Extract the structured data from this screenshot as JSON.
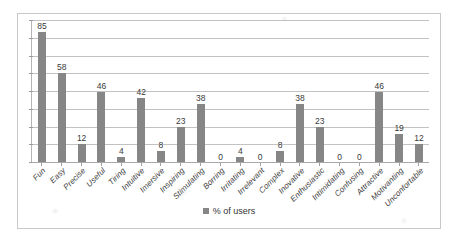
{
  "chart_data": {
    "type": "bar",
    "title": "",
    "xlabel": "",
    "ylabel": "",
    "ylim": [
      0,
      90
    ],
    "grid": true,
    "gridline_count": 9,
    "legend_position": "bottom-center",
    "bar_color": "#868686",
    "categories": [
      "Fun",
      "Easy",
      "Precise",
      "Useful",
      "Tiring",
      "Intuitive",
      "Imersive",
      "Inspiring",
      "Stimulating",
      "Borring",
      "Irritating",
      "Irrelevant",
      "Complex",
      "Inovative",
      "Enthusiastic",
      "Intimidating",
      "Confusing",
      "Attractive",
      "Motivanting",
      "Unconfortable"
    ],
    "values": [
      85,
      58,
      12,
      46,
      4,
      42,
      8,
      23,
      38,
      0,
      4,
      0,
      8,
      38,
      23,
      0,
      0,
      46,
      19,
      12
    ],
    "series": [
      {
        "name": "% of users",
        "values": [
          85,
          58,
          12,
          46,
          4,
          42,
          8,
          23,
          38,
          0,
          4,
          0,
          8,
          38,
          23,
          0,
          0,
          46,
          19,
          12
        ]
      }
    ]
  },
  "legend": {
    "marker": "square-marker",
    "label": "% of users"
  }
}
